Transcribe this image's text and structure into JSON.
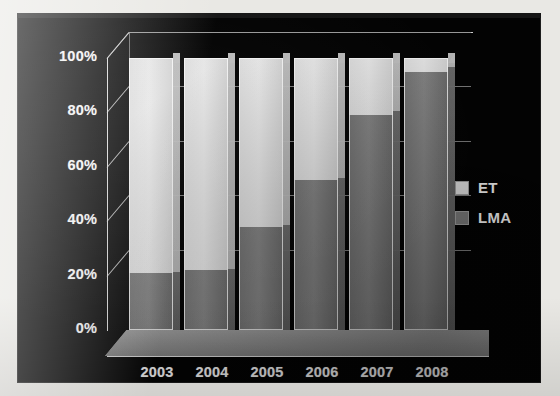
{
  "chart_data": {
    "type": "bar",
    "subtype": "stacked-100-percent-3d",
    "title": "",
    "xlabel": "",
    "ylabel": "",
    "categories": [
      "2003",
      "2004",
      "2005",
      "2006",
      "2007",
      "2008"
    ],
    "series": [
      {
        "name": "LMA",
        "color": "#7a7a7a",
        "values": [
          21,
          22,
          38,
          55,
          79,
          95
        ]
      },
      {
        "name": "ET",
        "color": "#dedede",
        "values": [
          79,
          78,
          62,
          45,
          21,
          5
        ]
      }
    ],
    "ylim": [
      0,
      100
    ],
    "y_ticks": [
      "0%",
      "20%",
      "40%",
      "60%",
      "80%",
      "100%"
    ],
    "y_tick_values": [
      0,
      20,
      40,
      60,
      80,
      100
    ],
    "grid": true,
    "legend_position": "right",
    "legend": [
      {
        "label": "ET",
        "color": "#dedede"
      },
      {
        "label": "LMA",
        "color": "#7a7a7a"
      }
    ],
    "background_color": "#030303",
    "text_color": "#f2f2f2"
  },
  "legend": {
    "items": [
      {
        "label": "ET",
        "swatch": "#dedede"
      },
      {
        "label": "LMA",
        "swatch": "#7a7a7a"
      }
    ]
  },
  "axes": {
    "y_ticks": [
      "100%",
      "80%",
      "60%",
      "40%",
      "20%",
      "0%"
    ],
    "x_ticks": [
      "2003",
      "2004",
      "2005",
      "2006",
      "2007",
      "2008"
    ]
  }
}
